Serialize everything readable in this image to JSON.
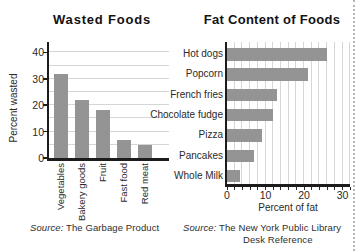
{
  "figure": {
    "bar_color": "#949494",
    "axis_color": "#1c1c1c",
    "grid_color": "#d6d6d6",
    "divider_color": "#b6b6b6"
  },
  "chart_data": [
    {
      "type": "bar",
      "orientation": "vertical",
      "title": "Wasted Foods",
      "categories": [
        "Vegetables",
        "Bakery goods",
        "Fruit",
        "Fast food",
        "Red meat"
      ],
      "values": [
        32,
        22,
        18,
        7,
        5
      ],
      "xlabel": "",
      "ylabel": "Percent wasted",
      "ylim": [
        0,
        44
      ],
      "yticks": [
        0,
        10,
        20,
        30,
        40
      ],
      "grid": true,
      "grid_step": 5,
      "source": {
        "prefix": "Source:",
        "text": " The Garbage Product"
      }
    },
    {
      "type": "bar",
      "orientation": "horizontal",
      "title": "Fat Content of Foods",
      "categories": [
        "Hot dogs",
        "Popcorn",
        "French fries",
        "Chocolate fudge",
        "Pizza",
        "Pancakes",
        "Whole Milk"
      ],
      "values": [
        26,
        21,
        13,
        12,
        9,
        7,
        3.5
      ],
      "xlabel": "Percent of fat",
      "ylabel": "",
      "xlim": [
        0,
        32
      ],
      "xticks": [
        0,
        10,
        20,
        30
      ],
      "grid": true,
      "grid_step": 2,
      "source": {
        "prefix": "Source:",
        "line1": " The New York Public Library",
        "line2": "Desk Reference"
      }
    }
  ]
}
